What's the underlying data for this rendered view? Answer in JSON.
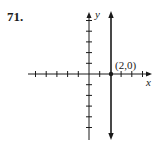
{
  "problem": {
    "number": "71."
  },
  "graph": {
    "x_axis_label": "x",
    "y_axis_label": "y",
    "point_label": "(2,0)",
    "point": {
      "x": 2,
      "y": 0
    },
    "line": "x = 2 (vertical line)",
    "x_ticks": [
      -5,
      -4,
      -3,
      -2,
      -1,
      1,
      2,
      3,
      4,
      5
    ],
    "y_ticks": [
      -5,
      -4,
      -3,
      -2,
      -1,
      1,
      2,
      3,
      4,
      5
    ],
    "colors": {
      "ink": "#1a1a1a",
      "background": "#ffffff"
    }
  }
}
